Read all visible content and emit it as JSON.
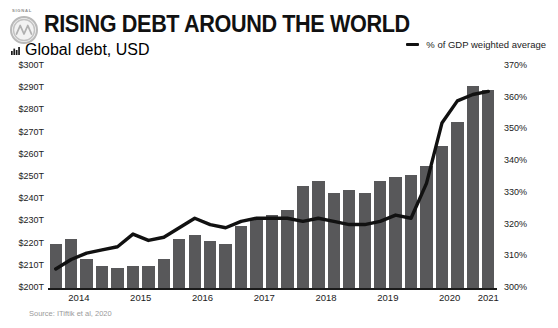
{
  "brand": {
    "word": "SIGNAL",
    "mark_icon": "signal-logo-icon"
  },
  "header": {
    "title": "RISING DEBT AROUND THE WORLD",
    "subtitle": "Global debt, USD",
    "subtitle_icon": "bar-chart-icon"
  },
  "legend": {
    "items": [
      {
        "label": "% of GDP weighted average",
        "color": "#111111",
        "marker": "line"
      }
    ]
  },
  "source": "Source: ITiftik et al, 2020",
  "colors": {
    "bar": "#58585a",
    "line": "#111111",
    "text": "#1b1b1b",
    "muted": "#9a9a9a",
    "background": "#ffffff"
  },
  "chart_data": {
    "type": "bar",
    "title": "RISING DEBT AROUND THE WORLD",
    "subtitle": "Global debt, USD",
    "xlabel": "",
    "ylabel": "Global debt, USD",
    "y2label": "% of GDP weighted average",
    "grid": false,
    "legend_position": "top-right",
    "ylim": [
      200,
      300
    ],
    "y2lim": [
      300,
      370
    ],
    "yticks": [
      "$200T",
      "$210T",
      "$220T",
      "$230T",
      "$240T",
      "$250T",
      "$260T",
      "$270T",
      "$280T",
      "$290T",
      "$300T"
    ],
    "ytick_values": [
      200,
      210,
      220,
      230,
      240,
      250,
      260,
      270,
      280,
      290,
      300
    ],
    "y2ticks": [
      "300%",
      "310%",
      "320%",
      "330%",
      "340%",
      "350%",
      "360%",
      "370%"
    ],
    "y2tick_values": [
      300,
      310,
      320,
      330,
      340,
      350,
      360,
      370
    ],
    "xticks": [
      "2014",
      "2015",
      "2016",
      "2017",
      "2018",
      "2019",
      "2020",
      "2021"
    ],
    "xtick_values": [
      2014,
      2015,
      2016,
      2017,
      2018,
      2019,
      2020,
      2021
    ],
    "categories": [
      "2014 Q1",
      "2014 Q2",
      "2014 Q3",
      "2014 Q4",
      "2015 Q1",
      "2015 Q2",
      "2015 Q3",
      "2015 Q4",
      "2016 Q1",
      "2016 Q2",
      "2016 Q3",
      "2016 Q4",
      "2017 Q1",
      "2017 Q2",
      "2017 Q3",
      "2017 Q4",
      "2018 Q1",
      "2018 Q2",
      "2018 Q3",
      "2018 Q4",
      "2019 Q1",
      "2019 Q2",
      "2019 Q3",
      "2019 Q4",
      "2020 Q1",
      "2020 Q2",
      "2020 Q3",
      "2020 Q4",
      "2021 Q1"
    ],
    "series": [
      {
        "name": "Global debt, USD",
        "type": "bar",
        "axis": "left",
        "unit": "T",
        "color": "#58585a",
        "values": [
          220,
          222,
          213,
          210,
          209,
          210,
          210,
          213,
          222,
          224,
          221,
          220,
          228,
          231,
          233,
          235,
          246,
          248,
          243,
          244,
          243,
          248,
          250,
          251,
          255,
          264,
          275,
          291,
          289
        ]
      },
      {
        "name": "% of GDP weighted average",
        "type": "line",
        "axis": "right",
        "unit": "%",
        "color": "#111111",
        "values": [
          306,
          309,
          311,
          312,
          313,
          317,
          315,
          316,
          319,
          322,
          320,
          319,
          321,
          322,
          322,
          322,
          321,
          322,
          321,
          320,
          320,
          321,
          323,
          322,
          333,
          352,
          359,
          361,
          362
        ]
      }
    ]
  }
}
